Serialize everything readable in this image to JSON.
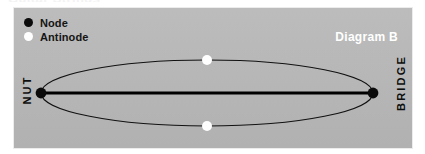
{
  "page": {
    "clipped_heading_text": "Guitar Strings"
  },
  "panel": {
    "background_color": "#b7b7b7",
    "caption": "Diagram B"
  },
  "legend": {
    "items": [
      {
        "label": "Node",
        "marker": "node-dot",
        "color": "#0b0b0b"
      },
      {
        "label": "Antinode",
        "marker": "antinode-dot",
        "color": "#ffffff"
      }
    ]
  },
  "end_labels": {
    "left": "NUT",
    "right": "BRIDGE"
  },
  "diagram": {
    "type": "standing-wave",
    "harmonic": 1,
    "string_line_color": "#000000",
    "envelope_color": "#111111",
    "node_color": "#0b0b0b",
    "antinode_color": "#ffffff",
    "ellipse": {
      "center_x": 193,
      "center_y": 85,
      "radius_x": 166,
      "radius_y": 33
    },
    "nodes": [
      {
        "x": 27,
        "y": 85,
        "label": "Node"
      },
      {
        "x": 359,
        "y": 85,
        "label": "Node"
      }
    ],
    "antinodes": [
      {
        "x": 193,
        "y": 52,
        "label": "Antinode"
      },
      {
        "x": 193,
        "y": 118,
        "label": "Antinode"
      }
    ]
  }
}
